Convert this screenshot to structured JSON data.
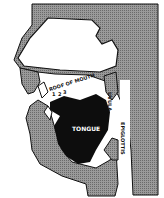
{
  "diagram": {
    "labels": {
      "roof_of_mouth": "ROOF OF MOUTH",
      "tongue": "TONGUE",
      "uvula": "UVULA",
      "epiglottis": "EPIGLOTTIS",
      "num1": "1",
      "num2": "2",
      "num3": "3"
    },
    "colors": {
      "tissue": "#8a8a8a",
      "tongue": "#0d0d0d",
      "outline": "#111111",
      "cavity": "#ffffff"
    }
  }
}
